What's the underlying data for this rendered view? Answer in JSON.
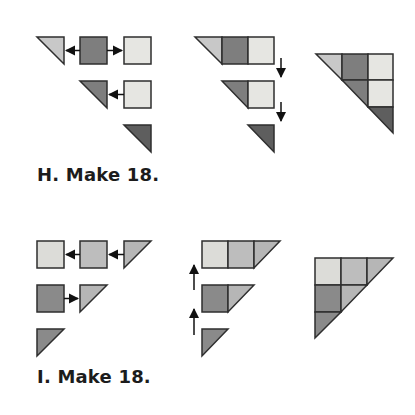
{
  "colors": {
    "outline": "#2e2e2e",
    "light": "#e6e6e2",
    "light_medium": "#c8c8c8",
    "medium": "#b0b0b0",
    "dark": "#7e7e7e",
    "darkest": "#5e5e5e",
    "arrow": "#111111",
    "text": "#1c1c1c"
  },
  "sections": [
    {
      "id": "H",
      "caption": "H. Make 18.",
      "step_labels": [
        "layout",
        "sew rows",
        "assembled block"
      ]
    },
    {
      "id": "I",
      "caption": "I. Make 18.",
      "step_labels": [
        "layout",
        "sew rows",
        "assembled block"
      ]
    }
  ]
}
